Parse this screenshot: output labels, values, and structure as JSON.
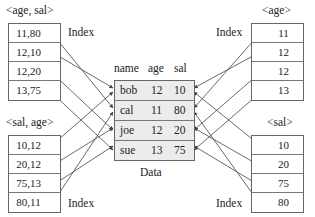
{
  "diagram": {
    "data_table": {
      "label": "Data",
      "columns": [
        "name",
        "age",
        "sal"
      ],
      "rows": [
        {
          "name": "bob",
          "age": "12",
          "sal": "10"
        },
        {
          "name": "cal",
          "age": "11",
          "sal": "80"
        },
        {
          "name": "joe",
          "age": "12",
          "sal": "20"
        },
        {
          "name": "sue",
          "age": "13",
          "sal": "75"
        }
      ]
    },
    "indexes": {
      "age_sal": {
        "title": "<age, sal>",
        "label": "Index",
        "entries": [
          "11,80",
          "12,10",
          "12,20",
          "13,75"
        ],
        "points_to": [
          "cal",
          "bob",
          "joe",
          "sue"
        ]
      },
      "sal_age": {
        "title": "<sal, age>",
        "label": "Index",
        "entries": [
          "10,12",
          "20,12",
          "75,13",
          "80,11"
        ],
        "points_to": [
          "bob",
          "joe",
          "sue",
          "cal"
        ]
      },
      "age": {
        "title": "<age>",
        "label": "Index",
        "entries": [
          "11",
          "12",
          "12",
          "13"
        ],
        "points_to": [
          "cal",
          "bob",
          "joe",
          "sue"
        ]
      },
      "sal": {
        "title": "<sal>",
        "label": "Index",
        "entries": [
          "10",
          "20",
          "75",
          "80"
        ],
        "points_to": [
          "bob",
          "joe",
          "sue",
          "cal"
        ]
      }
    },
    "colors": {
      "line": "#444444",
      "border": "#666666",
      "data_fill": "#ececec"
    }
  }
}
